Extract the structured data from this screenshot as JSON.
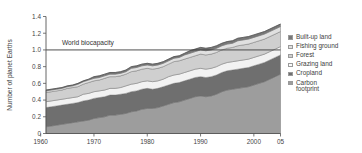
{
  "chart_data": {
    "type": "area",
    "title": "",
    "subtitle": "",
    "xlabel": "",
    "ylabel": "Number of planet Earths",
    "xlim": [
      1961,
      2005
    ],
    "ylim": [
      0,
      1.4
    ],
    "grid": false,
    "legend_position": "right",
    "x_tick_labels": [
      "1960",
      "1970",
      "1980",
      "1990",
      "2000",
      "05"
    ],
    "x_tick_values": [
      1960,
      1970,
      1980,
      1990,
      2000,
      2005
    ],
    "y_tick_labels": [
      "0",
      "0.2",
      "0.4",
      "0.6",
      "0.8",
      "1.0",
      "1.2",
      "1.4"
    ],
    "y_tick_values": [
      0,
      0.2,
      0.4,
      0.6,
      0.8,
      1.0,
      1.2,
      1.4
    ],
    "annotations": [
      {
        "text": "World biocapacity",
        "y": 1.0,
        "type": "hline-label"
      }
    ],
    "stacked": true,
    "x": [
      1961,
      1962,
      1963,
      1964,
      1965,
      1966,
      1967,
      1968,
      1969,
      1970,
      1971,
      1972,
      1973,
      1974,
      1975,
      1976,
      1977,
      1978,
      1979,
      1980,
      1981,
      1982,
      1983,
      1984,
      1985,
      1986,
      1987,
      1988,
      1989,
      1990,
      1991,
      1992,
      1993,
      1994,
      1995,
      1996,
      1997,
      1998,
      1999,
      2000,
      2001,
      2002,
      2003,
      2004,
      2005
    ],
    "series": [
      {
        "name": "Carbon footprint",
        "color": "#9d9d9d",
        "values": [
          0.08,
          0.09,
          0.1,
          0.11,
          0.12,
          0.13,
          0.14,
          0.15,
          0.16,
          0.18,
          0.19,
          0.2,
          0.22,
          0.22,
          0.23,
          0.24,
          0.26,
          0.27,
          0.29,
          0.3,
          0.3,
          0.31,
          0.33,
          0.35,
          0.37,
          0.38,
          0.4,
          0.42,
          0.44,
          0.45,
          0.44,
          0.45,
          0.47,
          0.5,
          0.52,
          0.53,
          0.54,
          0.55,
          0.56,
          0.58,
          0.6,
          0.62,
          0.65,
          0.68,
          0.71
        ]
      },
      {
        "name": "Cropland",
        "color": "#6f6f6f",
        "values": [
          0.23,
          0.23,
          0.23,
          0.23,
          0.23,
          0.23,
          0.23,
          0.24,
          0.24,
          0.24,
          0.24,
          0.24,
          0.24,
          0.24,
          0.24,
          0.24,
          0.24,
          0.24,
          0.24,
          0.24,
          0.23,
          0.23,
          0.23,
          0.23,
          0.23,
          0.23,
          0.23,
          0.23,
          0.23,
          0.23,
          0.23,
          0.23,
          0.23,
          0.23,
          0.23,
          0.23,
          0.23,
          0.23,
          0.23,
          0.23,
          0.23,
          0.23,
          0.23,
          0.23,
          0.23
        ]
      },
      {
        "name": "Grazing land",
        "color": "#f2f2f2",
        "values": [
          0.07,
          0.07,
          0.07,
          0.07,
          0.07,
          0.07,
          0.07,
          0.08,
          0.08,
          0.08,
          0.08,
          0.08,
          0.08,
          0.08,
          0.08,
          0.09,
          0.09,
          0.09,
          0.09,
          0.09,
          0.09,
          0.09,
          0.09,
          0.1,
          0.1,
          0.1,
          0.1,
          0.1,
          0.1,
          0.1,
          0.1,
          0.1,
          0.1,
          0.1,
          0.1,
          0.1,
          0.1,
          0.1,
          0.1,
          0.1,
          0.1,
          0.1,
          0.1,
          0.1,
          0.1
        ]
      },
      {
        "name": "Forest",
        "color": "#cfcfcf",
        "values": [
          0.11,
          0.11,
          0.11,
          0.11,
          0.12,
          0.12,
          0.12,
          0.12,
          0.13,
          0.13,
          0.13,
          0.14,
          0.14,
          0.14,
          0.14,
          0.14,
          0.15,
          0.15,
          0.15,
          0.15,
          0.15,
          0.15,
          0.15,
          0.15,
          0.16,
          0.16,
          0.16,
          0.16,
          0.16,
          0.17,
          0.17,
          0.17,
          0.17,
          0.17,
          0.17,
          0.17,
          0.18,
          0.18,
          0.18,
          0.18,
          0.18,
          0.18,
          0.18,
          0.18,
          0.18
        ]
      },
      {
        "name": "Fishing ground",
        "color": "#e0e0e0",
        "values": [
          0.02,
          0.02,
          0.02,
          0.02,
          0.02,
          0.02,
          0.03,
          0.03,
          0.03,
          0.03,
          0.03,
          0.03,
          0.03,
          0.03,
          0.03,
          0.03,
          0.04,
          0.04,
          0.04,
          0.04,
          0.04,
          0.04,
          0.04,
          0.04,
          0.04,
          0.04,
          0.05,
          0.05,
          0.05,
          0.05,
          0.05,
          0.05,
          0.05,
          0.05,
          0.05,
          0.05,
          0.06,
          0.06,
          0.06,
          0.06,
          0.06,
          0.06,
          0.06,
          0.06,
          0.06
        ]
      },
      {
        "name": "Built-up land",
        "color": "#787878",
        "values": [
          0.01,
          0.01,
          0.01,
          0.01,
          0.01,
          0.01,
          0.01,
          0.01,
          0.01,
          0.02,
          0.02,
          0.02,
          0.02,
          0.02,
          0.02,
          0.02,
          0.02,
          0.02,
          0.02,
          0.02,
          0.02,
          0.02,
          0.02,
          0.02,
          0.02,
          0.02,
          0.02,
          0.03,
          0.03,
          0.03,
          0.03,
          0.03,
          0.03,
          0.03,
          0.03,
          0.03,
          0.03,
          0.03,
          0.03,
          0.03,
          0.03,
          0.03,
          0.03,
          0.03,
          0.03
        ]
      }
    ],
    "totals": [
      0.52,
      0.53,
      0.54,
      0.55,
      0.57,
      0.58,
      0.6,
      0.63,
      0.65,
      0.68,
      0.69,
      0.71,
      0.73,
      0.73,
      0.74,
      0.76,
      0.8,
      0.81,
      0.83,
      0.84,
      0.83,
      0.84,
      0.86,
      0.89,
      0.92,
      0.93,
      0.96,
      0.99,
      1.01,
      1.03,
      1.02,
      1.03,
      1.05,
      1.08,
      1.1,
      1.11,
      1.13,
      1.15,
      1.16,
      1.18,
      1.2,
      1.22,
      1.25,
      1.28,
      1.31
    ]
  },
  "legend": {
    "items": [
      {
        "label": "Built-up land",
        "color": "#787878"
      },
      {
        "label": "Fishing ground",
        "color": "#e0e0e0"
      },
      {
        "label": "Forest",
        "color": "#cfcfcf"
      },
      {
        "label": "Grazing land",
        "color": "#fbfbfb"
      },
      {
        "label": "Cropland",
        "color": "#6f6f6f"
      },
      {
        "label": "Carbon\nfootprint",
        "color": "#9d9d9d"
      }
    ]
  },
  "axis": {
    "y_title": "Number of planet Earths"
  },
  "annotation": {
    "biocapacity_label": "World biocapacity"
  }
}
